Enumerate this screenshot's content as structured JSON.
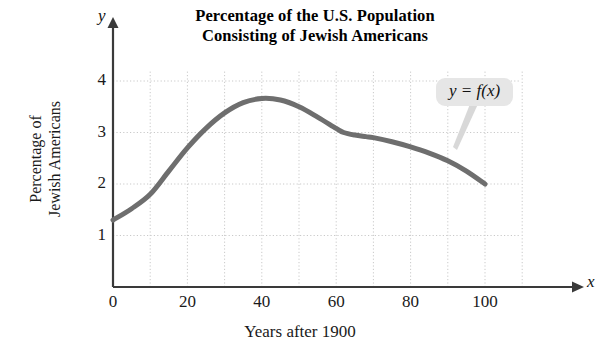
{
  "chart_data": {
    "type": "line",
    "title": "Percentage of the U.S. Population Consisting of Jewish Americans",
    "title_line1": "Percentage of the U.S. Population",
    "title_line2": "Consisting of Jewish Americans",
    "xlabel": "Years after 1900",
    "ylabel": "Percentage of Jewish Americans",
    "ylabel_line1": "Percentage of",
    "ylabel_line2": "Jewish Americans",
    "x_axis_name": "x",
    "y_axis_name": "y",
    "xlim": [
      0,
      110
    ],
    "ylim": [
      0,
      4.4
    ],
    "xticks": [
      0,
      20,
      40,
      60,
      80,
      100
    ],
    "yticks": [
      1,
      2,
      3,
      4
    ],
    "grid": true,
    "grid_x_step": 10,
    "grid_y_step": 1,
    "legend": "none",
    "annotation": "y = f(x)",
    "series": [
      {
        "name": "f(x)",
        "color": "#6e6e6e",
        "x": [
          0,
          5,
          10,
          15,
          20,
          25,
          30,
          35,
          40,
          45,
          50,
          55,
          60,
          62,
          65,
          68,
          70,
          75,
          80,
          85,
          90,
          95,
          100
        ],
        "values": [
          1.3,
          1.52,
          1.8,
          2.25,
          2.7,
          3.08,
          3.38,
          3.58,
          3.66,
          3.63,
          3.5,
          3.3,
          3.08,
          3.0,
          2.95,
          2.92,
          2.9,
          2.82,
          2.72,
          2.6,
          2.45,
          2.25,
          2.0
        ]
      }
    ]
  },
  "plot_geometry": {
    "origin_x_px": 113,
    "origin_y_px": 287,
    "x_scale_px_per_unit": 3.72,
    "y_scale_px_per_unit": 51.5,
    "grid_right_px": 520,
    "grid_top_px": 70,
    "x_axis_end_px": 580,
    "y_axis_top_px": 18
  },
  "colors": {
    "curve": "#6e6e6e",
    "axis": "#3a3a3a",
    "grid": "#c9c9c9",
    "callout_bg": "#e6e6e6",
    "text": "#1a1a1a"
  }
}
